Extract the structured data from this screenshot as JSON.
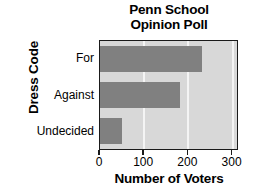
{
  "chart_data": {
    "type": "bar",
    "orientation": "horizontal",
    "title": "Penn School Opinion Poll",
    "title_lines": [
      "Penn School",
      "Opinion Poll"
    ],
    "categories": [
      "For",
      "Against",
      "Undecided"
    ],
    "values": [
      230,
      180,
      50
    ],
    "xlabel": "Number of Voters",
    "ylabel": "Dress Code",
    "xlim": [
      0,
      310
    ],
    "xticks": [
      0,
      100,
      200,
      300
    ],
    "xtick_labels": [
      "0",
      "100",
      "200",
      "300"
    ],
    "grid": true,
    "grid_axis": "x",
    "legend": false,
    "colors": {
      "bar": "#808080",
      "plot_background": "#d8d8d8",
      "gridline": "#f4f4f4",
      "axis": "#1a1a1a",
      "text": "#000000",
      "figure_background": "#ffffff"
    }
  }
}
